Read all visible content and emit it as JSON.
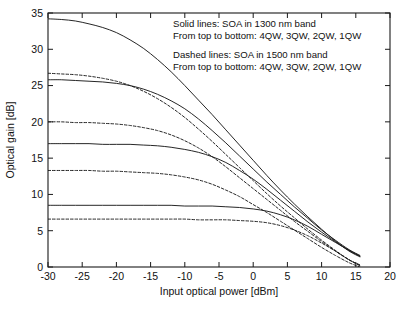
{
  "chart_data": {
    "type": "line",
    "title": "",
    "xlabel": "Input optical power [dBm]",
    "ylabel": "Optical gain [dB]",
    "xlim": [
      -30,
      20
    ],
    "ylim": [
      0,
      35
    ],
    "xticks": [
      "-30",
      "-25",
      "-20",
      "-15",
      "-10",
      "-5",
      "0",
      "5",
      "10",
      "15",
      "20"
    ],
    "xtick_values": [
      -30,
      -25,
      -20,
      -15,
      -10,
      -5,
      0,
      5,
      10,
      15,
      20
    ],
    "yticks": [
      "0",
      "5",
      "10",
      "15",
      "20",
      "25",
      "30",
      "35"
    ],
    "ytick_values": [
      0,
      5,
      10,
      15,
      20,
      25,
      30,
      35
    ],
    "grid": false,
    "legend_position": "none",
    "annotations": [
      "Solid lines: SOA in 1300 nm band",
      "From top to bottom: 4QW, 3QW, 2QW, 1QW",
      "Dashed lines: SOA in 1500 nm band",
      "From top to bottom: 4QW, 3QW, 2QW, 1QW"
    ],
    "line_color": "#1a1a1a",
    "series": [
      {
        "name": "4QW (1300 nm band)",
        "style": "solid",
        "band": "1300 nm",
        "small_signal_gain": 34.2,
        "x": [
          -30,
          -28,
          -26,
          -24,
          -22,
          -20,
          -18,
          -16,
          -14,
          -12,
          -10,
          -8,
          -6,
          -4,
          -2,
          0,
          2,
          4,
          6,
          8,
          10,
          12,
          14,
          15.6
        ],
        "y": [
          34.2,
          34.1,
          33.9,
          33.5,
          33.0,
          32.3,
          31.3,
          30.1,
          28.6,
          26.9,
          25.0,
          23.0,
          21.0,
          18.9,
          16.8,
          14.7,
          12.6,
          10.6,
          8.7,
          6.9,
          5.2,
          3.6,
          2.2,
          1.4
        ]
      },
      {
        "name": "4QW (1500 nm band)",
        "style": "dashed",
        "band": "1500 nm",
        "small_signal_gain": 26.7,
        "x": [
          -30,
          -28,
          -26,
          -24,
          -22,
          -20,
          -18,
          -16,
          -14,
          -12,
          -10,
          -8,
          -6,
          -4,
          -2,
          0,
          2,
          4,
          6,
          8,
          10,
          12,
          14,
          15.6
        ],
        "y": [
          26.7,
          26.6,
          26.5,
          26.3,
          26.0,
          25.6,
          25.0,
          24.2,
          23.2,
          22.0,
          20.6,
          19.0,
          17.3,
          15.5,
          13.7,
          11.9,
          10.1,
          8.4,
          6.8,
          5.2,
          3.7,
          2.3,
          1.0,
          0.3
        ]
      },
      {
        "name": "3QW (1300 nm band)",
        "style": "solid",
        "band": "1300 nm",
        "small_signal_gain": 25.8,
        "x": [
          -30,
          -28,
          -26,
          -24,
          -22,
          -20,
          -18,
          -16,
          -14,
          -12,
          -10,
          -8,
          -6,
          -4,
          -2,
          0,
          2,
          4,
          6,
          8,
          10,
          12,
          14,
          15.6
        ],
        "y": [
          25.8,
          25.8,
          25.7,
          25.6,
          25.5,
          25.3,
          25.0,
          24.5,
          23.8,
          22.9,
          21.8,
          20.4,
          18.8,
          17.1,
          15.3,
          13.5,
          11.7,
          10.0,
          8.3,
          6.7,
          5.1,
          3.7,
          2.4,
          1.6
        ]
      },
      {
        "name": "3QW (1500 nm band)",
        "style": "dashed",
        "band": "1500 nm",
        "small_signal_gain": 20.0,
        "x": [
          -30,
          -28,
          -26,
          -24,
          -22,
          -20,
          -18,
          -16,
          -14,
          -12,
          -10,
          -8,
          -6,
          -4,
          -2,
          0,
          2,
          4,
          6,
          8,
          10,
          12,
          14,
          15.6
        ],
        "y": [
          20.0,
          20.0,
          19.9,
          19.9,
          19.8,
          19.7,
          19.5,
          19.2,
          18.8,
          18.2,
          17.4,
          16.4,
          15.2,
          13.8,
          12.3,
          10.8,
          9.3,
          7.8,
          6.3,
          4.9,
          3.5,
          2.2,
          1.0,
          0.2
        ]
      },
      {
        "name": "2QW (1300 nm band)",
        "style": "solid",
        "band": "1300 nm",
        "small_signal_gain": 17.0,
        "x": [
          -30,
          -28,
          -26,
          -24,
          -22,
          -20,
          -18,
          -16,
          -14,
          -12,
          -10,
          -8,
          -6,
          -4,
          -2,
          0,
          2,
          4,
          6,
          8,
          10,
          12,
          14,
          15.6
        ],
        "y": [
          17.0,
          17.0,
          17.0,
          17.0,
          16.9,
          16.9,
          16.9,
          16.8,
          16.7,
          16.5,
          16.2,
          15.8,
          15.2,
          14.4,
          13.3,
          12.1,
          10.7,
          9.2,
          7.7,
          6.2,
          4.8,
          3.5,
          2.3,
          1.5
        ]
      },
      {
        "name": "2QW (1500 nm band)",
        "style": "dashed",
        "band": "1500 nm",
        "small_signal_gain": 13.3,
        "x": [
          -30,
          -28,
          -26,
          -24,
          -22,
          -20,
          -18,
          -16,
          -14,
          -12,
          -10,
          -8,
          -6,
          -4,
          -2,
          0,
          2,
          4,
          6,
          8,
          10,
          12,
          14,
          15.6
        ],
        "y": [
          13.3,
          13.3,
          13.3,
          13.3,
          13.2,
          13.2,
          13.1,
          13.0,
          12.9,
          12.7,
          12.4,
          12.0,
          11.4,
          10.6,
          9.7,
          8.6,
          7.5,
          6.3,
          5.1,
          3.9,
          2.7,
          1.6,
          0.6,
          0.0
        ]
      },
      {
        "name": "1QW (1300 nm band)",
        "style": "solid",
        "band": "1300 nm",
        "small_signal_gain": 8.5,
        "x": [
          -30,
          -28,
          -26,
          -24,
          -22,
          -20,
          -18,
          -16,
          -14,
          -12,
          -10,
          -8,
          -6,
          -4,
          -2,
          0,
          2,
          4,
          6,
          8,
          10,
          12,
          14,
          15.6
        ],
        "y": [
          8.5,
          8.5,
          8.5,
          8.5,
          8.5,
          8.5,
          8.5,
          8.5,
          8.5,
          8.5,
          8.4,
          8.4,
          8.4,
          8.3,
          8.2,
          8.0,
          7.7,
          7.2,
          6.5,
          5.6,
          4.5,
          3.4,
          2.3,
          1.5
        ]
      },
      {
        "name": "1QW (1500 nm band)",
        "style": "dashed",
        "band": "1500 nm",
        "small_signal_gain": 6.6,
        "x": [
          -30,
          -28,
          -26,
          -24,
          -22,
          -20,
          -18,
          -16,
          -14,
          -12,
          -10,
          -8,
          -6,
          -4,
          -2,
          0,
          2,
          4,
          6,
          8,
          10,
          12,
          14,
          15.6
        ],
        "y": [
          6.6,
          6.6,
          6.6,
          6.6,
          6.6,
          6.6,
          6.6,
          6.6,
          6.6,
          6.6,
          6.6,
          6.5,
          6.5,
          6.5,
          6.4,
          6.3,
          6.1,
          5.7,
          5.1,
          4.3,
          3.3,
          2.2,
          1.0,
          0.2
        ]
      }
    ]
  }
}
